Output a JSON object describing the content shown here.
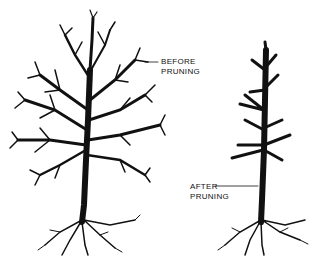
{
  "diagram": {
    "labels": {
      "before": {
        "line1": "BEFORE",
        "line2": "PRUNING"
      },
      "after": {
        "line1": "AFTER",
        "line2": "PRUNING"
      }
    },
    "colors": {
      "ink": "#111111",
      "background": "#ffffff"
    },
    "figures": [
      {
        "name": "tree-before-pruning",
        "description": "Full tree with dense branching canopy"
      },
      {
        "name": "tree-after-pruning",
        "description": "Tree with branches cut back to stubs"
      }
    ]
  }
}
